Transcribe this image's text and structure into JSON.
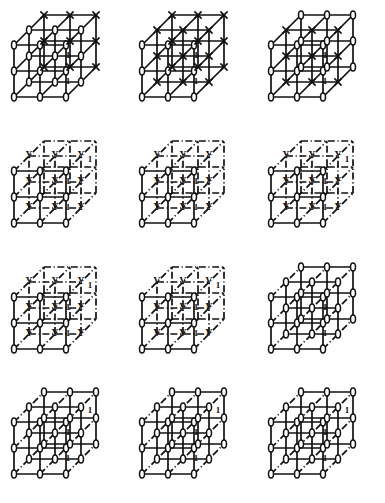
{
  "figure": {
    "title": "",
    "columns": 3,
    "rows": 4,
    "panel_count": 12,
    "lattice": {
      "nodes_per_edge": 3,
      "cell_size": 26,
      "depth_dx": 15,
      "depth_dy": -15,
      "origin_x": 14,
      "origin_y": 97
    },
    "colors": {
      "ink": "#111111",
      "paper": "#ffffff"
    },
    "marker_glyphs": {
      "0": "oval",
      "X": "cross",
      "Y": "letter",
      "Z": "letter",
      "V": "letter",
      "none": "none"
    },
    "edge_styles": {
      "S": "solid",
      "D": "dashdot"
    },
    "edge_label_text": "1",
    "panels": [
      {
        "index": 1,
        "name": "panel-r1c1",
        "front_marker": "0",
        "back_marker": "X",
        "mid_marker": "0",
        "style_front": "S",
        "style_back": "S",
        "style_depth": "S",
        "labels": [
          "1",
          "1"
        ]
      },
      {
        "index": 2,
        "name": "panel-r1c2",
        "front_marker": "0",
        "back_marker": "X",
        "mid_marker": "X",
        "style_front": "S",
        "style_back": "S",
        "style_depth": "S",
        "labels": [
          "1",
          "1"
        ]
      },
      {
        "index": 3,
        "name": "panel-r1c3",
        "front_marker": "0",
        "back_marker": "0",
        "mid_marker": "X",
        "style_front": "S",
        "style_back": "S",
        "style_depth": "S",
        "labels": [
          "1",
          "1"
        ]
      },
      {
        "index": 4,
        "name": "panel-r2c1",
        "front_marker": "0",
        "back_marker": "none",
        "mid_marker": "Y",
        "style_front": "S",
        "style_back": "D",
        "style_depth": "D",
        "labels": [
          "1",
          "1",
          "1"
        ]
      },
      {
        "index": 5,
        "name": "panel-r2c2",
        "front_marker": "0",
        "back_marker": "none",
        "mid_marker": "Y",
        "style_front": "S",
        "style_back": "D",
        "style_depth": "D",
        "labels": [
          "1",
          "1"
        ]
      },
      {
        "index": 6,
        "name": "panel-r2c3",
        "front_marker": "0",
        "back_marker": "none",
        "mid_marker": "Y",
        "style_front": "S",
        "style_back": "D",
        "style_depth": "D",
        "labels": [
          "1",
          "1",
          "1"
        ]
      },
      {
        "index": 7,
        "name": "panel-r3c1",
        "front_marker": "0",
        "back_marker": "none",
        "mid_marker": "Y",
        "style_front": "S",
        "style_back": "D",
        "style_depth": "D",
        "labels": [
          "1",
          "1",
          "1"
        ]
      },
      {
        "index": 8,
        "name": "panel-r3c2",
        "front_marker": "0",
        "back_marker": "none",
        "mid_marker": "V",
        "style_front": "S",
        "style_back": "D",
        "style_depth": "D",
        "labels": [
          "1",
          "1",
          "1"
        ]
      },
      {
        "index": 9,
        "name": "panel-r3c3",
        "front_marker": "0",
        "back_marker": "0",
        "mid_marker": "0",
        "style_front": "S",
        "style_back": "S",
        "style_depth": "D",
        "labels": [
          "1",
          "1"
        ]
      },
      {
        "index": 10,
        "name": "panel-r4c1",
        "front_marker": "0",
        "back_marker": "0",
        "mid_marker": "0",
        "style_front": "S",
        "style_back": "S",
        "style_depth": "D",
        "labels": [
          "1",
          "1",
          "1"
        ]
      },
      {
        "index": 11,
        "name": "panel-r4c2",
        "front_marker": "0",
        "back_marker": "0",
        "mid_marker": "0",
        "style_front": "S",
        "style_back": "S",
        "style_depth": "D",
        "labels": [
          "1",
          "1",
          "1"
        ]
      },
      {
        "index": 12,
        "name": "panel-r4c3",
        "front_marker": "0",
        "back_marker": "0",
        "mid_marker": "0",
        "style_front": "S",
        "style_back": "S",
        "style_depth": "D",
        "labels": [
          "1",
          "1",
          "1"
        ]
      }
    ]
  }
}
